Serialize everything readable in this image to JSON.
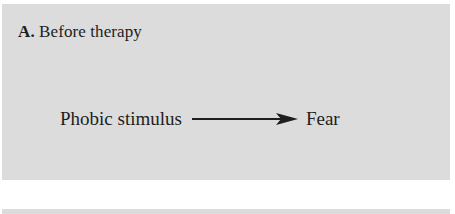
{
  "panel": {
    "label_letter": "A.",
    "label_text": " Before therapy",
    "diagram": {
      "source": "Phobic stimulus",
      "target": "Fear",
      "connector": "arrow-right"
    }
  },
  "colors": {
    "panel_background": "#dcdcdc",
    "text": "#1e1e1e"
  }
}
